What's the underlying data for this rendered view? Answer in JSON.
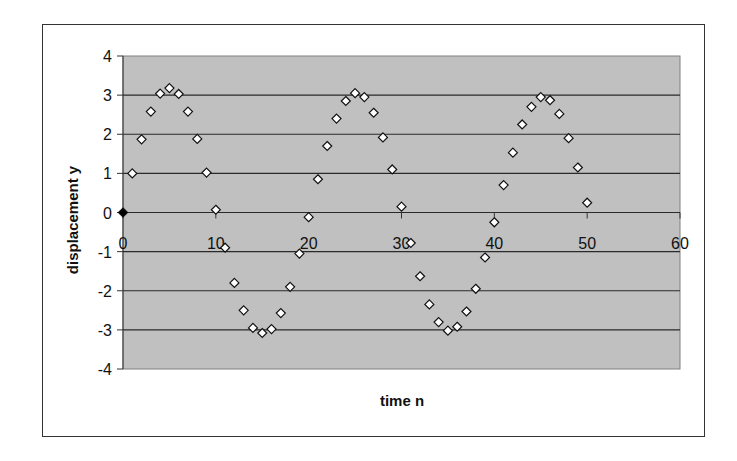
{
  "chart_data": {
    "type": "scatter",
    "title": "",
    "xlabel": "time n",
    "ylabel": "displacement y",
    "xlim": [
      0,
      60
    ],
    "ylim": [
      -4,
      4
    ],
    "x_ticks": [
      0,
      10,
      20,
      30,
      40,
      50,
      60
    ],
    "y_ticks": [
      4,
      3,
      2,
      1,
      0,
      -1,
      -2,
      -3,
      -4
    ],
    "grid": {
      "horizontal": true,
      "vertical": false
    },
    "legend": null,
    "plot_background": "#c0c0c0",
    "marker": "diamond-open",
    "series": [
      {
        "name": "displacement",
        "x": [
          0,
          1,
          2,
          3,
          4,
          5,
          6,
          7,
          8,
          9,
          10,
          11,
          12,
          13,
          14,
          15,
          16,
          17,
          18,
          19,
          20,
          21,
          22,
          23,
          24,
          25,
          26,
          27,
          28,
          29,
          30,
          31,
          32,
          33,
          34,
          35,
          36,
          37,
          38,
          39,
          40,
          41,
          42,
          43,
          44,
          45,
          46,
          47,
          48,
          49,
          50
        ],
        "y": [
          0,
          1.0,
          1.87,
          2.58,
          3.04,
          3.18,
          3.03,
          2.58,
          1.88,
          1.02,
          0.07,
          -0.9,
          -1.8,
          -2.5,
          -2.95,
          -3.08,
          -2.98,
          -2.57,
          -1.9,
          -1.05,
          -0.12,
          0.85,
          1.7,
          2.4,
          2.85,
          3.05,
          2.95,
          2.55,
          1.92,
          1.1,
          0.15,
          -0.78,
          -1.63,
          -2.35,
          -2.8,
          -3.02,
          -2.92,
          -2.53,
          -1.95,
          -1.15,
          -0.25,
          0.7,
          1.53,
          2.25,
          2.7,
          2.95,
          2.87,
          2.52,
          1.9,
          1.15,
          0.25
        ]
      }
    ]
  }
}
